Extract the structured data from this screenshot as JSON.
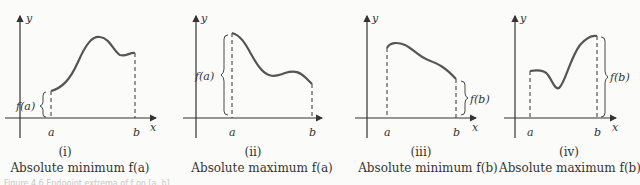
{
  "panels": [
    {
      "id": "i",
      "numeral": "(i)",
      "caption": "Absolute minimum f(a)",
      "y_axis": "y",
      "x_axis": "x",
      "a_label": "a",
      "b_label": "b",
      "brace_label": "f(a)",
      "brace_side": "left"
    },
    {
      "id": "ii",
      "numeral": "(ii)",
      "caption": "Absolute maximum f(a)",
      "y_axis": "y",
      "x_axis": "x",
      "a_label": "a",
      "b_label": "b",
      "brace_label": "f(a)",
      "brace_side": "left"
    },
    {
      "id": "iii",
      "numeral": "(iii)",
      "caption": "Absolute minimum f(b)",
      "y_axis": "y",
      "x_axis": "x",
      "a_label": "a",
      "b_label": "b",
      "brace_label": "f(b)",
      "brace_side": "right"
    },
    {
      "id": "iv",
      "numeral": "(iv)",
      "caption": "Absolute maximum f(b)",
      "y_axis": "y",
      "x_axis": "x",
      "a_label": "a",
      "b_label": "b",
      "brace_label": "f(b)",
      "brace_side": "right"
    }
  ],
  "footer": {
    "text": "Figure 4.6  Endpoint extrema of f on [a, b]"
  },
  "colors": {
    "curve": "#555555",
    "axis": "#333333",
    "background": "#fbfbf9"
  }
}
